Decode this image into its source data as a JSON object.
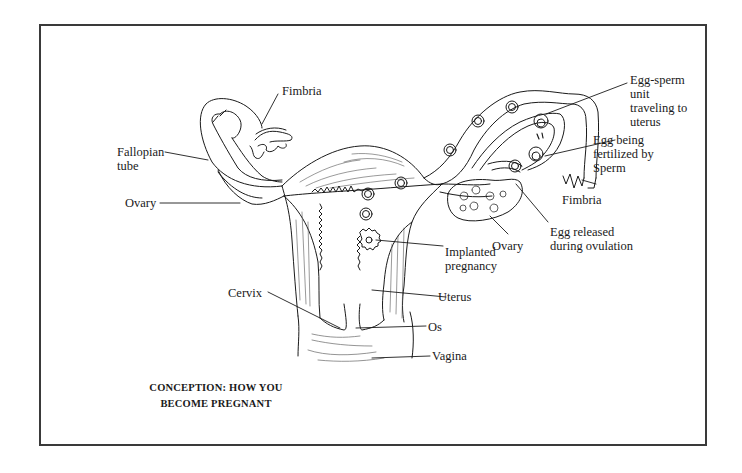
{
  "diagram": {
    "caption": {
      "line1": "CONCEPTION: HOW YOU",
      "line2": "BECOME PREGNANT"
    },
    "labels": {
      "fimbria_left": "Fimbria",
      "fallopian_tube": {
        "line1": "Fallopian",
        "line2": "tube"
      },
      "ovary_left": "Ovary",
      "egg_sperm_unit": {
        "line1": "Egg-sperm",
        "line2": "unit",
        "line3": "traveling to",
        "line4": "uterus"
      },
      "egg_fertilized": {
        "line1": "Egg being",
        "line2": "fertilized by",
        "line3": "Sperm"
      },
      "fimbria_right": "Fimbria",
      "egg_released": {
        "line1": "Egg released",
        "line2": "during ovulation"
      },
      "ovary_right": "Ovary",
      "implanted_pregnancy": {
        "line1": "Implanted",
        "line2": "pregnancy"
      },
      "uterus": "Uterus",
      "cervix": "Cervix",
      "os": "Os",
      "vagina": "Vagina"
    },
    "colors": {
      "ink": "#1a1a1a",
      "frame": "#3a3a3a",
      "background": "#ffffff"
    }
  }
}
